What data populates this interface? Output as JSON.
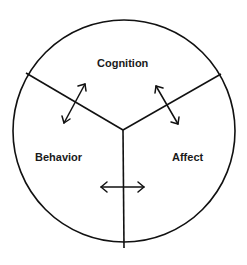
{
  "diagram": {
    "type": "tripartite circle",
    "segments": [
      {
        "id": "cognition",
        "label": "Cognition"
      },
      {
        "id": "behavior",
        "label": "Behavior"
      },
      {
        "id": "affect",
        "label": "Affect"
      }
    ],
    "arrows": [
      {
        "between": [
          "cognition",
          "behavior"
        ],
        "style": "double-headed"
      },
      {
        "between": [
          "cognition",
          "affect"
        ],
        "style": "double-headed"
      },
      {
        "between": [
          "behavior",
          "affect"
        ],
        "style": "double-headed"
      }
    ],
    "colors": {
      "stroke": "#111111",
      "background": "#ffffff",
      "text": "#1a1a1a"
    }
  }
}
